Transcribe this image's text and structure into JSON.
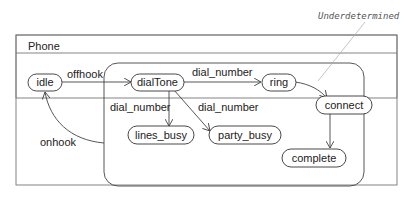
{
  "diagram": {
    "frame_title": "Phone",
    "annotation": "Underdetermined",
    "states": {
      "idle": "idle",
      "dialTone": "dialTone",
      "ring": "ring",
      "connect": "connect",
      "lines_busy": "lines_busy",
      "party_busy": "party_busy",
      "complete": "complete"
    },
    "transitions": {
      "offhook": "offhook",
      "dial_number_ring": "dial_number",
      "dial_number_lines_busy": "dial_number",
      "dial_number_party_busy": "dial_number",
      "onhook": "onhook"
    },
    "colors": {
      "stroke": "#333333",
      "frame": "#777777",
      "note": "#999999"
    }
  }
}
